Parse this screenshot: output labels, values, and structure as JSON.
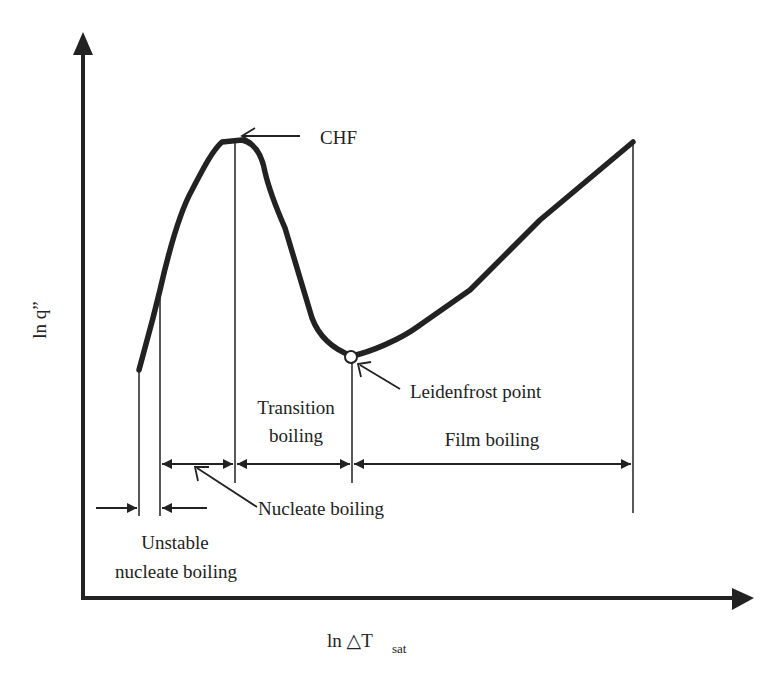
{
  "diagram": {
    "colors": {
      "ink": "#222222",
      "background": "#ffffff"
    },
    "axes": {
      "y_label": "ln q”",
      "x_label_main": "ln △T",
      "x_label_sub": "sat"
    },
    "annotations": {
      "chf": "CHF",
      "leidenfrost": "Leidenfrost point",
      "transition_line1": "Transition",
      "transition_line2": "boiling",
      "film": "Film boiling",
      "nucleate": "Nucleate boiling",
      "unstable_line1": "Unstable",
      "unstable_line2": "nucleate boiling"
    },
    "regions": [
      {
        "name": "Unstable nucleate boiling",
        "x_start_px": 139,
        "x_end_px": 160
      },
      {
        "name": "Nucleate boiling",
        "x_start_px": 160,
        "x_end_px": 235
      },
      {
        "name": "Transition boiling",
        "x_start_px": 235,
        "x_end_px": 352
      },
      {
        "name": "Film boiling",
        "x_start_px": 352,
        "x_end_px": 633
      }
    ],
    "key_points": [
      {
        "name": "Onset",
        "x_px": 139,
        "y_px": 370
      },
      {
        "name": "CHF",
        "x_px": 235,
        "y_px": 140
      },
      {
        "name": "Leidenfrost point",
        "x_px": 352,
        "y_px": 356
      },
      {
        "name": "End",
        "x_px": 633,
        "y_px": 140
      }
    ]
  }
}
